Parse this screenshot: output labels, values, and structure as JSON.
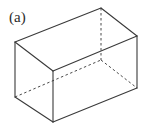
{
  "figure": {
    "panel_label": "(a)",
    "caption_position": "top-left",
    "background_color": "#ffffff",
    "shape_name": "rectangular-box-wireframe",
    "projection": "oblique-parallel",
    "line_color_visible": "#3a3a3a",
    "line_color_hidden": "#4a4a4a",
    "line_width_visible": 1.1,
    "line_width_hidden": 1.0,
    "hidden_edge_dash": "2.5 2.5",
    "vertices": {
      "front_top_left": {
        "x": 15,
        "y": 42
      },
      "front_bottom_left": {
        "x": 15,
        "y": 97
      },
      "front_top_center": {
        "x": 53,
        "y": 71
      },
      "front_bottom_center": {
        "x": 53,
        "y": 122
      },
      "top_back_left": {
        "x": 101,
        "y": 8
      },
      "back_bottom_hidden": {
        "x": 101,
        "y": 60
      },
      "right_top": {
        "x": 137,
        "y": 36
      },
      "right_bottom": {
        "x": 137,
        "y": 88
      }
    },
    "visible_edges": [
      {
        "name": "top-left-slant",
        "from": "front_top_left",
        "to": "top_back_left"
      },
      {
        "name": "top-right-slant",
        "from": "top_back_left",
        "to": "right_top"
      },
      {
        "name": "top-front-left",
        "from": "front_top_left",
        "to": "front_top_center"
      },
      {
        "name": "top-front-right",
        "from": "front_top_center",
        "to": "right_top"
      },
      {
        "name": "left-vertical",
        "from": "front_top_left",
        "to": "front_bottom_left"
      },
      {
        "name": "center-vertical",
        "from": "front_top_center",
        "to": "front_bottom_center"
      },
      {
        "name": "right-vertical",
        "from": "right_top",
        "to": "right_bottom"
      },
      {
        "name": "bottom-front-left",
        "from": "front_bottom_left",
        "to": "front_bottom_center"
      },
      {
        "name": "bottom-front-right",
        "from": "front_bottom_center",
        "to": "right_bottom"
      }
    ],
    "hidden_edges": [
      {
        "name": "back-vertical-dashed",
        "from": "top_back_left",
        "to": "back_bottom_hidden"
      },
      {
        "name": "bottom-back-left-dashed",
        "from": "front_bottom_left",
        "to": "back_bottom_hidden"
      },
      {
        "name": "bottom-back-right-dashed",
        "from": "back_bottom_hidden",
        "to": "right_bottom"
      }
    ]
  }
}
